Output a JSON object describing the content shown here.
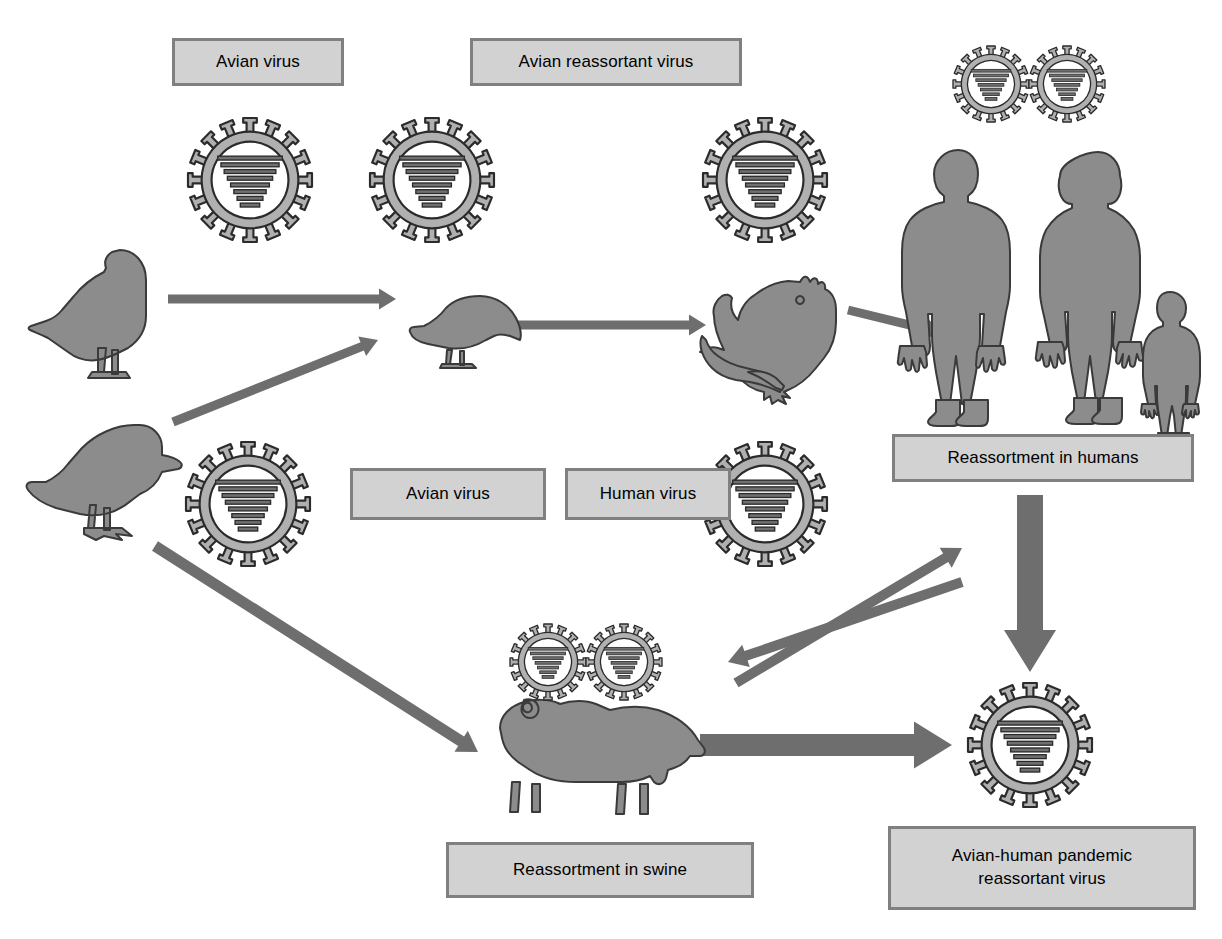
{
  "diagram": {
    "colors": {
      "box_fill": "#d2d2d2",
      "box_border": "#808080",
      "arrow": "#6e6e6e",
      "silhouette_fill": "#8c8c8c",
      "silhouette_stroke": "#3a3a3a",
      "virus_ring": "#b0b0b0",
      "virus_outline": "#2b2b2b",
      "virus_segment": "#707070",
      "background": "#ffffff"
    },
    "labels": [
      {
        "id": "avian-virus-top",
        "text": "Avian virus",
        "x": 172,
        "y": 38,
        "w": 172,
        "h": 48
      },
      {
        "id": "avian-reassortant-virus",
        "text": "Avian reassortant virus",
        "x": 470,
        "y": 38,
        "w": 272,
        "h": 48
      },
      {
        "id": "avian-virus-mid",
        "text": "Avian virus",
        "x": 350,
        "y": 468,
        "w": 196,
        "h": 52
      },
      {
        "id": "human-virus",
        "text": "Human virus",
        "x": 565,
        "y": 468,
        "w": 166,
        "h": 52
      },
      {
        "id": "reassortment-in-humans",
        "text": "Reassortment in humans",
        "x": 892,
        "y": 434,
        "w": 302,
        "h": 48
      },
      {
        "id": "reassortment-in-swine",
        "text": "Reassortment in swine",
        "x": 446,
        "y": 842,
        "w": 308,
        "h": 56
      },
      {
        "id": "avian-human-pandemic",
        "text": "Avian-human pandemic\nreassortant virus",
        "line1": "Avian-human pandemic",
        "line2": "reassortant virus",
        "x": 888,
        "y": 826,
        "w": 308,
        "h": 84
      }
    ],
    "virus_particles": [
      {
        "id": "virus-avian-1",
        "cx": 250,
        "cy": 180,
        "r": 62,
        "segments": 8
      },
      {
        "id": "virus-avian-reassortant",
        "cx": 432,
        "cy": 180,
        "r": 62,
        "segments": 8
      },
      {
        "id": "virus-rooster",
        "cx": 765,
        "cy": 180,
        "r": 62,
        "segments": 8
      },
      {
        "id": "virus-human-pair-left",
        "cx": 991,
        "cy": 84,
        "r": 38,
        "segments": 7
      },
      {
        "id": "virus-human-pair-right",
        "cx": 1067,
        "cy": 84,
        "r": 38,
        "segments": 7
      },
      {
        "id": "virus-avian-duck",
        "cx": 248,
        "cy": 504,
        "r": 62,
        "segments": 8
      },
      {
        "id": "virus-human-mid",
        "cx": 765,
        "cy": 504,
        "r": 62,
        "segments": 8
      },
      {
        "id": "virus-swine-pair-left",
        "cx": 548,
        "cy": 662,
        "r": 38,
        "segments": 7
      },
      {
        "id": "virus-swine-pair-right",
        "cx": 624,
        "cy": 662,
        "r": 38,
        "segments": 7
      },
      {
        "id": "virus-pandemic",
        "cx": 1030,
        "cy": 745,
        "r": 62,
        "segments": 8
      }
    ],
    "animals": [
      {
        "id": "goose",
        "name": "goose-silhouette",
        "x": 28,
        "y": 248,
        "w": 138,
        "h": 120
      },
      {
        "id": "duck",
        "name": "duck-silhouette",
        "x": 22,
        "y": 412,
        "w": 160,
        "h": 125
      },
      {
        "id": "sparrow",
        "name": "sparrow-silhouette",
        "x": 408,
        "y": 290,
        "w": 120,
        "h": 78
      },
      {
        "id": "rooster",
        "name": "rooster-silhouette",
        "x": 710,
        "y": 270,
        "w": 128,
        "h": 125
      },
      {
        "id": "pig",
        "name": "pig-silhouette",
        "x": 496,
        "y": 700,
        "w": 210,
        "h": 120
      }
    ],
    "humans": [
      {
        "id": "man",
        "name": "man-silhouette",
        "x": 903,
        "y": 148,
        "w": 110,
        "h": 262
      },
      {
        "id": "woman",
        "name": "woman-silhouette",
        "x": 1050,
        "y": 150,
        "w": 98,
        "h": 258
      },
      {
        "id": "child",
        "name": "child-silhouette",
        "x": 1140,
        "y": 290,
        "w": 58,
        "h": 118
      }
    ],
    "arrows": [
      {
        "id": "goose-to-sparrow",
        "x1": 168,
        "y1": 299,
        "x2": 396,
        "y2": 299,
        "w": 9,
        "head": 17
      },
      {
        "id": "duck-to-sparrow",
        "x1": 173,
        "y1": 422,
        "x2": 378,
        "y2": 340,
        "w": 9,
        "head": 17
      },
      {
        "id": "sparrow-to-rooster",
        "x1": 518,
        "y1": 325,
        "x2": 706,
        "y2": 325,
        "w": 9,
        "head": 17
      },
      {
        "id": "rooster-to-humans",
        "x1": 848,
        "y1": 310,
        "x2": 942,
        "y2": 333,
        "w": 9,
        "head": 17
      },
      {
        "id": "duck-to-pig",
        "x1": 155,
        "y1": 546,
        "x2": 478,
        "y2": 752,
        "w": 11,
        "head": 20
      },
      {
        "id": "swine-to-human-up",
        "x1": 736,
        "y1": 683,
        "x2": 962,
        "y2": 548,
        "w": 10,
        "head": 19
      },
      {
        "id": "human-to-swine-down",
        "x1": 962,
        "y1": 582,
        "x2": 728,
        "y2": 662,
        "w": 10,
        "head": 19
      },
      {
        "id": "humans-to-pandemic",
        "x1": 1030,
        "y1": 495,
        "x2": 1030,
        "y2": 672,
        "w": 26,
        "head": 42
      },
      {
        "id": "pig-to-pandemic",
        "x1": 700,
        "y1": 745,
        "x2": 952,
        "y2": 745,
        "w": 22,
        "head": 38
      }
    ]
  }
}
